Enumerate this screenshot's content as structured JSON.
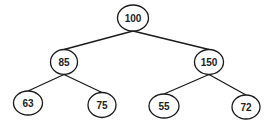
{
  "diagram": {
    "type": "binary-tree",
    "colors": {
      "stroke": "#1a1a1a",
      "fill": "#ffffff",
      "text": "#222222"
    },
    "nodes": [
      {
        "id": "n100",
        "label": "100",
        "cx": 133,
        "cy": 18,
        "rx": 15.5,
        "ry": 13
      },
      {
        "id": "n85",
        "label": "85",
        "cx": 64,
        "cy": 62,
        "rx": 13.5,
        "ry": 12.5
      },
      {
        "id": "n150",
        "label": "150",
        "cx": 209,
        "cy": 62,
        "rx": 14.5,
        "ry": 12.5
      },
      {
        "id": "n63",
        "label": "63",
        "cx": 28,
        "cy": 103,
        "rx": 14.5,
        "ry": 12
      },
      {
        "id": "n75",
        "label": "75",
        "cx": 102,
        "cy": 105,
        "rx": 14,
        "ry": 12.5
      },
      {
        "id": "n55",
        "label": "55",
        "cx": 164,
        "cy": 106,
        "rx": 15,
        "ry": 12
      },
      {
        "id": "n72",
        "label": "72",
        "cx": 246,
        "cy": 107,
        "rx": 14,
        "ry": 12
      }
    ],
    "edges": [
      {
        "from": "n100",
        "to": "n85"
      },
      {
        "from": "n100",
        "to": "n150"
      },
      {
        "from": "n85",
        "to": "n63"
      },
      {
        "from": "n85",
        "to": "n75"
      },
      {
        "from": "n150",
        "to": "n55"
      },
      {
        "from": "n150",
        "to": "n72"
      }
    ]
  }
}
